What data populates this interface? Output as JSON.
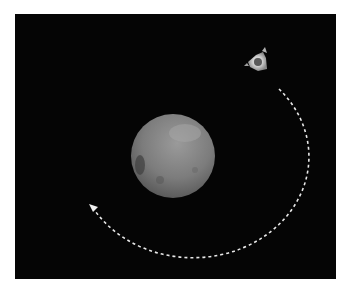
{
  "scene": {
    "description": "Spacecraft orbiting a small grey planetary body with a dashed trajectory arc",
    "background_color": "#050505",
    "frame_color": "#ffffff",
    "planet": {
      "center_x": 173,
      "center_y": 156,
      "radius": 42,
      "color": "#7a7a7a"
    },
    "spacecraft": {
      "x": 257,
      "y": 62
    },
    "trajectory": {
      "style": "dashed",
      "color": "#e8e8e8",
      "direction": "counter-clockwise",
      "arrowhead": true
    }
  }
}
